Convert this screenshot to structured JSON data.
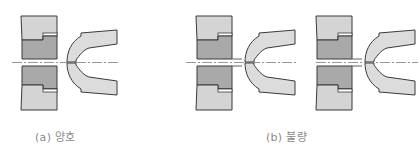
{
  "figure": {
    "panels": [
      {
        "id": "a",
        "caption": "(a) 양호",
        "state": "good"
      },
      {
        "id": "b",
        "caption": "(b) 불량",
        "state": "defective"
      }
    ],
    "colors": {
      "background": "#ffffff",
      "die_light": "#d4d4d4",
      "die_dark": "#a9a9a9",
      "workpiece": "#dcdcdc",
      "outline": "#3a3a3a",
      "centerline": "#7a7a7a",
      "caption": "#8a8a8a"
    }
  }
}
